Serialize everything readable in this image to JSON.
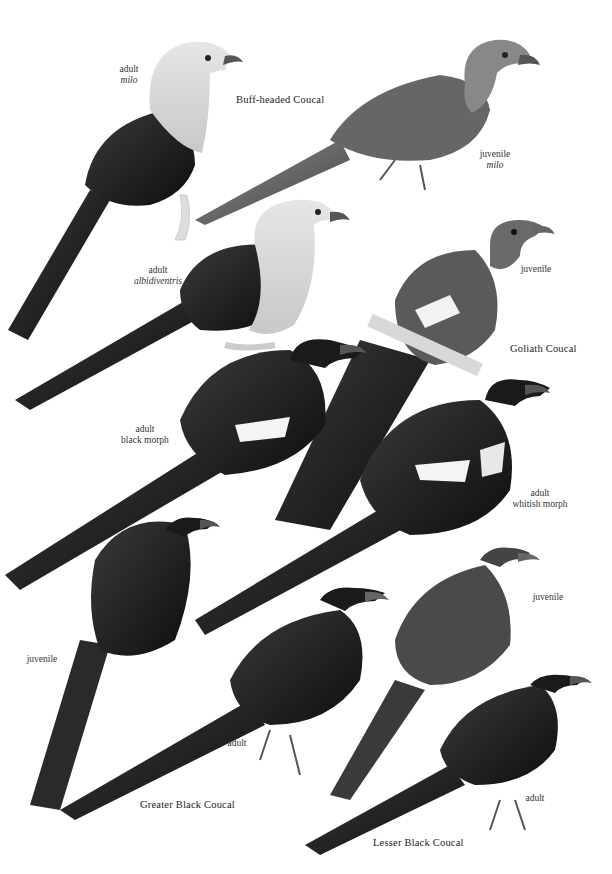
{
  "plate": {
    "species": [
      {
        "name": "Buff-headed Coucal",
        "figures": [
          {
            "age": "adult",
            "subspecies": "milo"
          },
          {
            "age": "juvenile",
            "subspecies": "milo"
          },
          {
            "age": "adult",
            "subspecies": "albidiventris"
          }
        ]
      },
      {
        "name": "Goliath Coucal",
        "figures": [
          {
            "age": "juvenile",
            "subspecies": ""
          },
          {
            "age": "adult",
            "morph": "black morph"
          },
          {
            "age": "adult",
            "morph": "whitish morph"
          }
        ]
      },
      {
        "name": "Greater Black Coucal",
        "figures": [
          {
            "age": "juvenile"
          },
          {
            "age": "adult"
          }
        ]
      },
      {
        "name": "Lesser Black Coucal",
        "figures": [
          {
            "age": "juvenile"
          },
          {
            "age": "adult"
          }
        ]
      }
    ],
    "colors": {
      "background": "#ffffff",
      "dark_plumage": "#1a1a1a",
      "buff_head": "#d6d6d6",
      "text": "#2a2a2a"
    }
  }
}
